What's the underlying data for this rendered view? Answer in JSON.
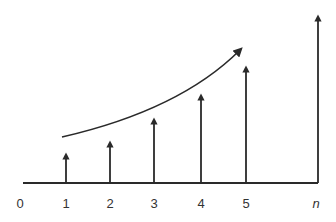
{
  "diagram": {
    "type": "stem-sequence",
    "colors": {
      "stroke": "#2a2a2a",
      "label": "#333333"
    },
    "axis_labels": [
      "0",
      "1",
      "2",
      "3",
      "4",
      "5",
      "n"
    ],
    "stems": [
      {
        "label": "1",
        "x": 66,
        "top": 153
      },
      {
        "label": "2",
        "x": 110,
        "top": 141
      },
      {
        "label": "3",
        "x": 154,
        "top": 118
      },
      {
        "label": "4",
        "x": 201,
        "top": 94
      },
      {
        "label": "5",
        "x": 246,
        "top": 66
      },
      {
        "label": "n",
        "x": 318,
        "top": 15
      }
    ],
    "baseline_y": 183,
    "label_positions": [
      20,
      66,
      110,
      154,
      201,
      246,
      316
    ]
  }
}
